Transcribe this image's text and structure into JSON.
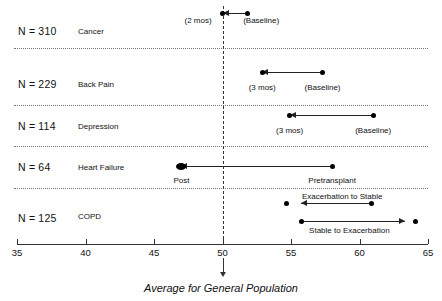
{
  "chart_data": {
    "type": "scatter",
    "title": "",
    "xlabel": "Average for General Population",
    "ylabel": "",
    "xlim": [
      35,
      65
    ],
    "xticks": [
      35,
      40,
      45,
      50,
      55,
      60,
      65
    ],
    "xticklabels": [
      "35",
      "40",
      "45",
      "50",
      "55",
      "60",
      "65"
    ],
    "grid": false,
    "legend": "none",
    "reference_line": {
      "value": 50,
      "style": "dashed",
      "label": "Average for General Population"
    },
    "groups": [
      {
        "condition": "Cancer",
        "n_label": "N = 310",
        "points": [
          {
            "label": "(Baseline)",
            "value": 51.8
          },
          {
            "label": "(2 mos)",
            "value": 50.0
          }
        ],
        "arrows": [
          {
            "from": 51.8,
            "to": 50.0,
            "direction": "left"
          }
        ]
      },
      {
        "condition": "Back Pain",
        "n_label": "N = 229",
        "points": [
          {
            "label": "(Baseline)",
            "value": 57.3
          },
          {
            "label": "(3 mos)",
            "value": 52.9
          }
        ],
        "arrows": [
          {
            "from": 57.3,
            "to": 52.9,
            "direction": "left"
          }
        ]
      },
      {
        "condition": "Depression",
        "n_label": "N = 114",
        "points": [
          {
            "label": "(Baseline)",
            "value": 61.0
          },
          {
            "label": "(3 mos)",
            "value": 54.9
          }
        ],
        "arrows": [
          {
            "from": 61.0,
            "to": 54.9,
            "direction": "left"
          }
        ]
      },
      {
        "condition": "Heart Failure",
        "n_label": "N = 64",
        "points": [
          {
            "label": "Pretransplant",
            "value": 58.0
          },
          {
            "label": "Post",
            "value": 47.0
          }
        ],
        "arrows": [
          {
            "from": 58.0,
            "to": 47.0,
            "direction": "left"
          }
        ]
      },
      {
        "condition": "COPD",
        "n_label": "N = 125",
        "points": [
          {
            "label": "Exacerbation to Stable",
            "value": 60.9
          },
          {
            "label": "Stable to Exacerbation",
            "value": 55.8
          }
        ],
        "arrows": [
          {
            "label": "Exacerbation to Stable",
            "from": 60.9,
            "to": 55.7,
            "direction": "left"
          },
          {
            "label": "Stable to Exacerbation",
            "from": 55.8,
            "to": 63.3,
            "direction": "right"
          }
        ]
      }
    ]
  },
  "rows": {
    "cancer": {
      "n": "N = 310",
      "name": "Cancer",
      "p1": "(2 mos)",
      "p2": "(Baseline)"
    },
    "back_pain": {
      "n": "N = 229",
      "name": "Back Pain",
      "p1": "(3 mos)",
      "p2": "(Baseline)"
    },
    "depression": {
      "n": "N = 114",
      "name": "Depression",
      "p1": "(3 mos)",
      "p2": "(Baseline)"
    },
    "heart_failure": {
      "n": "N = 64",
      "name": "Heart Failure",
      "p1": "Post",
      "p2": "Pretransplant"
    },
    "copd": {
      "n": "N = 125",
      "name": "COPD",
      "a1": "Exacerbation to Stable",
      "a2": "Stable to Exacerbation"
    }
  },
  "axis": {
    "t0": "35",
    "t1": "40",
    "t2": "45",
    "t3": "50",
    "t4": "55",
    "t5": "60",
    "t6": "65"
  },
  "caption": {
    "text": "Average for General Population"
  }
}
